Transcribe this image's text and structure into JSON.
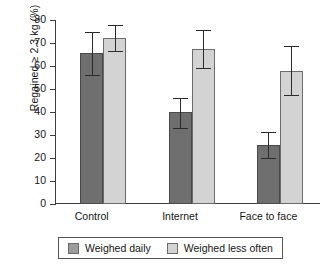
{
  "chart_data": {
    "type": "bar",
    "title": "",
    "xlabel": "",
    "ylabel": "Regained ≥ 2.3 kg (%)",
    "ylim": [
      0,
      80
    ],
    "ytick_values": [
      80,
      70,
      60,
      50,
      40,
      30,
      20,
      10,
      0
    ],
    "ytick_labels": [
      "80",
      "70",
      "60",
      "50",
      "40",
      "30",
      "20",
      "10",
      "0"
    ],
    "grid": false,
    "legend_position": "bottom",
    "categories": [
      "Control",
      "Internet",
      "Face to face"
    ],
    "series": [
      {
        "name": "Weighed daily",
        "color": "#6f6f6f",
        "values": [
          65.5,
          40.0,
          25.5
        ],
        "err_low": [
          56.0,
          33.0,
          20.0
        ],
        "err_high": [
          75.0,
          46.0,
          31.5
        ]
      },
      {
        "name": "Weighed less often",
        "color": "#d3d3d3",
        "values": [
          72.0,
          67.5,
          58.0
        ],
        "err_low": [
          66.5,
          59.0,
          47.5
        ],
        "err_high": [
          78.0,
          75.5,
          68.5
        ]
      }
    ]
  },
  "legend": {
    "entries": [
      {
        "label": "Weighed daily"
      },
      {
        "label": "Weighed less often"
      }
    ]
  }
}
